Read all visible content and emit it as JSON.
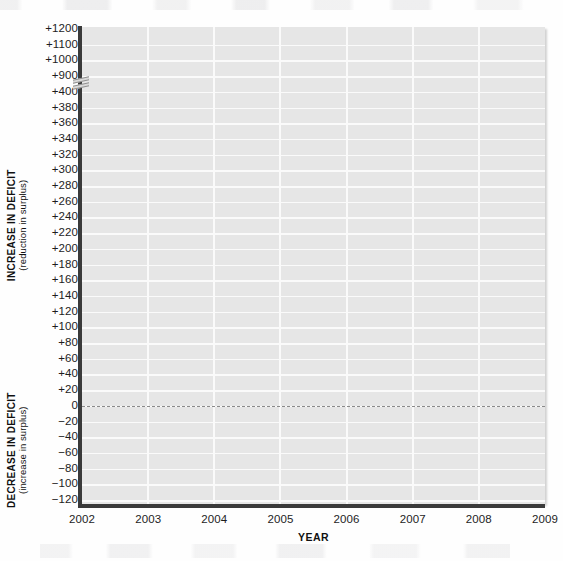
{
  "chart_data": {
    "type": "line",
    "title": "",
    "subtitle": "",
    "xlabel": "YEAR",
    "ylabel_upper_main": "INCREASE IN DEFICIT",
    "ylabel_upper_sub": "(reduction in surplus)",
    "ylabel_lower_main": "DECREASE IN DEFICIT",
    "ylabel_lower_sub": "(increase in surplus)",
    "x_categories": [
      "2002",
      "2003",
      "2004",
      "2005",
      "2006",
      "2007",
      "2008",
      "2009"
    ],
    "y_tick_labels": [
      "+1200",
      "+1100",
      "+1000",
      "+900",
      "+400",
      "+380",
      "+360",
      "+340",
      "+320",
      "+300",
      "+280",
      "+260",
      "+240",
      "+220",
      "+200",
      "+180",
      "+160",
      "+140",
      "+120",
      "+100",
      "+80",
      "+60",
      "+40",
      "+20",
      "0",
      "−20",
      "−40",
      "−60",
      "−80",
      "−100",
      "−120"
    ],
    "y_tick_values": [
      1200,
      1100,
      1000,
      900,
      400,
      380,
      360,
      340,
      320,
      300,
      280,
      260,
      240,
      220,
      200,
      180,
      160,
      140,
      120,
      100,
      80,
      60,
      40,
      20,
      0,
      -20,
      -40,
      -60,
      -80,
      -100,
      -120
    ],
    "axis_break": {
      "present": true,
      "between_labels": [
        "+900",
        "+400"
      ]
    },
    "zero_line": {
      "value": 0,
      "style": "dashed"
    },
    "grid": {
      "horizontal": true,
      "vertical": true,
      "color": "#fafafa"
    },
    "legend": {
      "present": false,
      "entries": []
    },
    "series": [],
    "values": [],
    "annotations": [],
    "plot_background_color": "#e6e6e6",
    "axis_color": "#3a3a3a",
    "text_color": "#1d1d1d",
    "note": "Empty plotting grid — no data series are drawn on the chart."
  }
}
